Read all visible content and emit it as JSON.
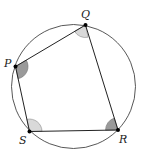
{
  "diagram": {
    "circle": {
      "cx": 73.5,
      "cy": 86.5,
      "r": 62,
      "stroke": "#444444"
    },
    "vertices": {
      "P": {
        "label": "P",
        "x": 15.5,
        "y": 66.5
      },
      "Q": {
        "label": "Q",
        "x": 85.5,
        "y": 25
      },
      "R": {
        "label": "R",
        "x": 118,
        "y": 130
      },
      "S": {
        "label": "S",
        "x": 29.5,
        "y": 131.5
      }
    },
    "angle_marks": [
      {
        "vertex": "P",
        "shade": "dark",
        "color": "#9a9a9a"
      },
      {
        "vertex": "Q",
        "shade": "light",
        "color": "#d9d9d9"
      },
      {
        "vertex": "R",
        "shade": "dark",
        "color": "#9a9a9a"
      },
      {
        "vertex": "S",
        "shade": "light",
        "color": "#d9d9d9"
      }
    ]
  }
}
